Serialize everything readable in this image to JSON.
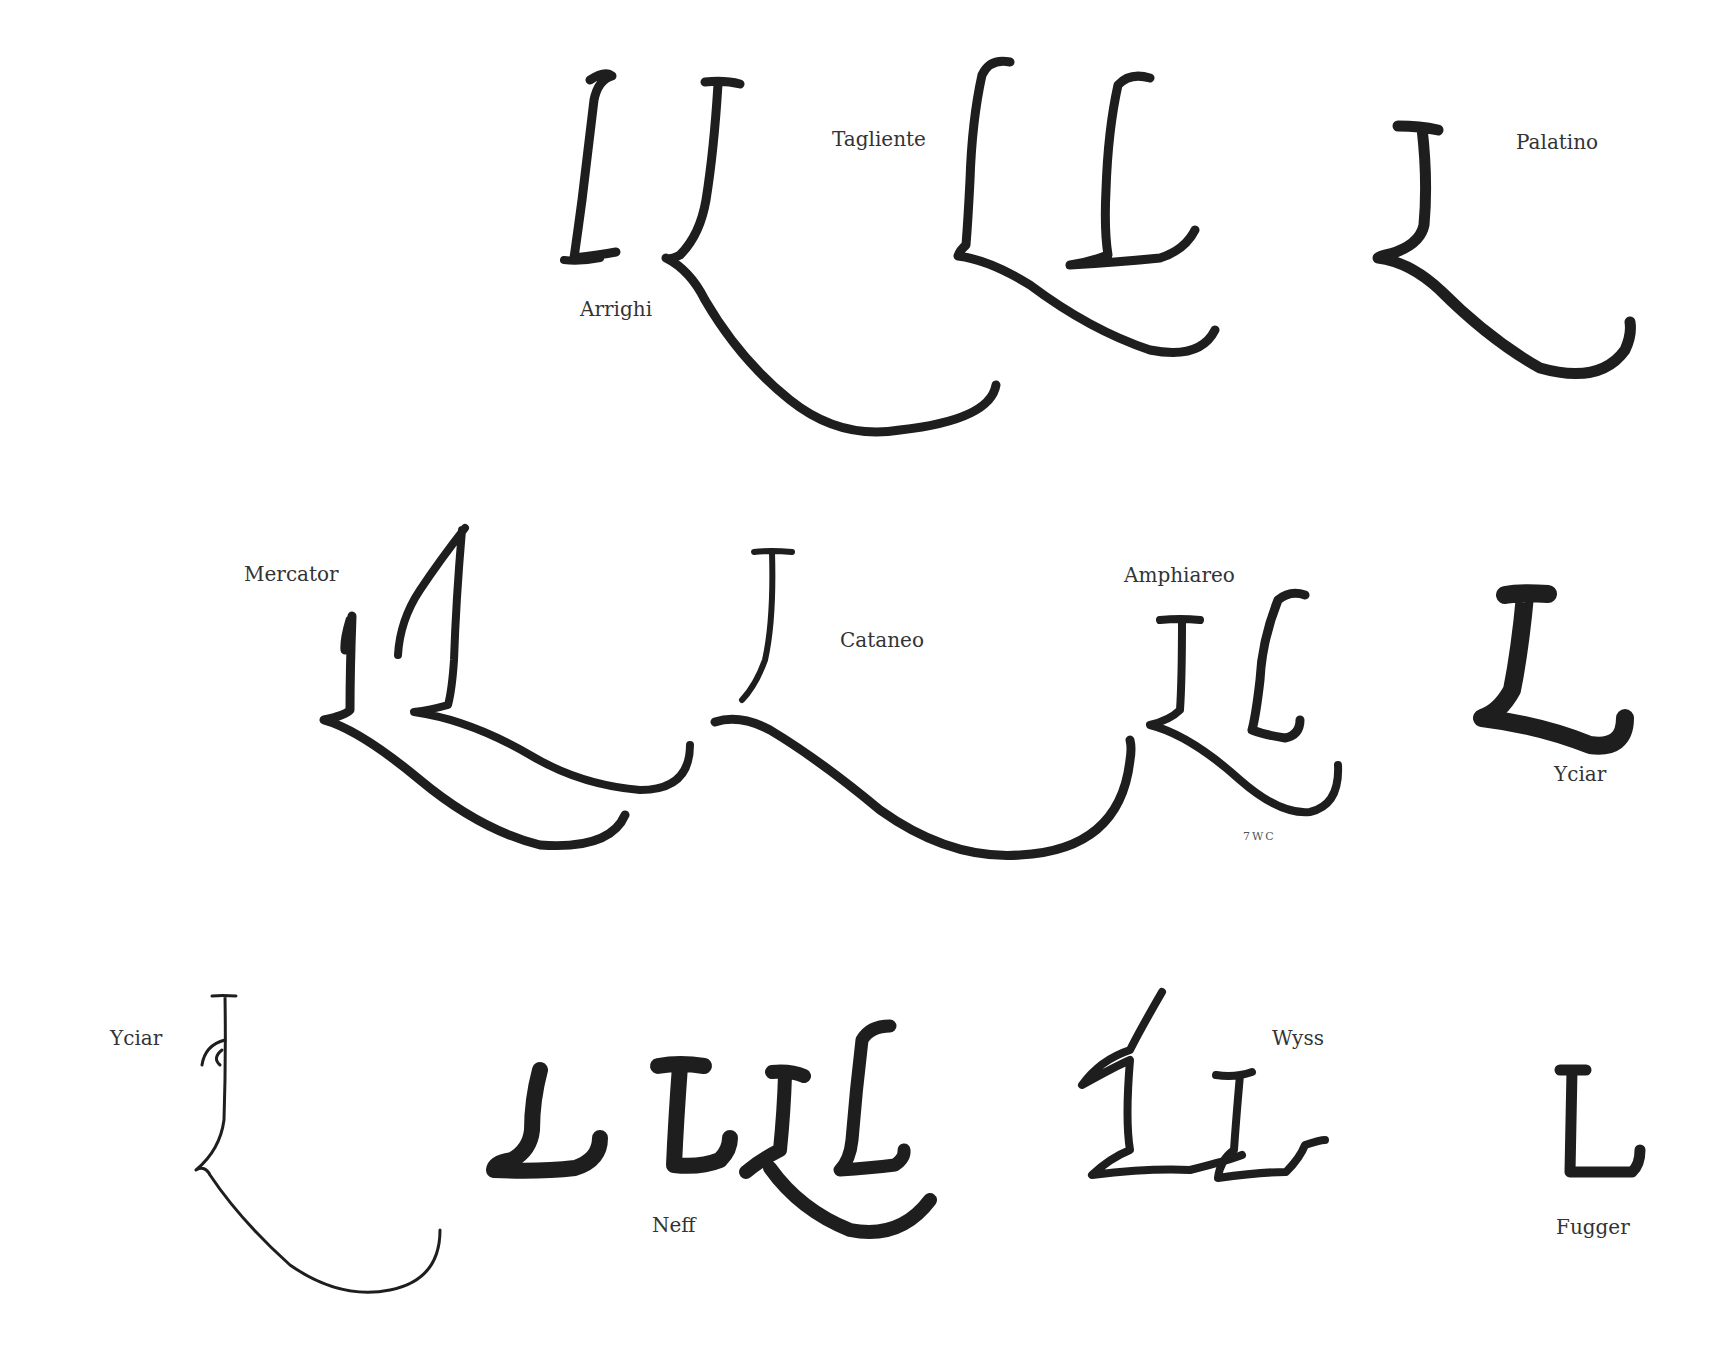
{
  "figure": {
    "glyph_color": "#1e1e1e",
    "background": "#ffffff"
  },
  "labels": {
    "arrighi": "Arrighi",
    "tagliente": "Tagliente",
    "palatino": "Palatino",
    "mercator": "Mercator",
    "cataneo": "Cataneo",
    "amphiareo": "Amphiareo",
    "yciar_top": "Yciar",
    "initials": "7WC",
    "yciar_bottom": "Yciar",
    "neff": "Neff",
    "wyss": "Wyss",
    "fugger": "Fugger"
  },
  "rows": [
    {
      "row": 1,
      "groups": [
        "Arrighi",
        "Tagliente",
        "Palatino"
      ]
    },
    {
      "row": 2,
      "groups": [
        "Mercator",
        "Cataneo",
        "Amphiareo",
        "Yciar"
      ]
    },
    {
      "row": 3,
      "groups": [
        "Yciar",
        "Neff",
        "Wyss",
        "Fugger"
      ]
    }
  ]
}
